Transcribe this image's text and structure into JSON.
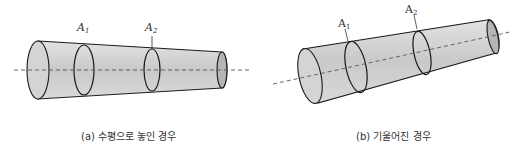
{
  "figure_a": {
    "caption": "(a) 수평으로 놓인 경우",
    "label_a1": "A",
    "label_a1_sub": "1",
    "label_a2": "A",
    "label_a2_sub": "2"
  },
  "figure_b": {
    "caption": "(b) 기울어진 경우",
    "label_a1": "A",
    "label_a1_sub": "1",
    "label_a2": "A",
    "label_a2_sub": "2"
  },
  "colors": {
    "fill": "#cfcfcf",
    "fill_end": "#b8b8b8",
    "stroke": "#1a1a1a",
    "axis": "#555555",
    "text": "#333333"
  }
}
